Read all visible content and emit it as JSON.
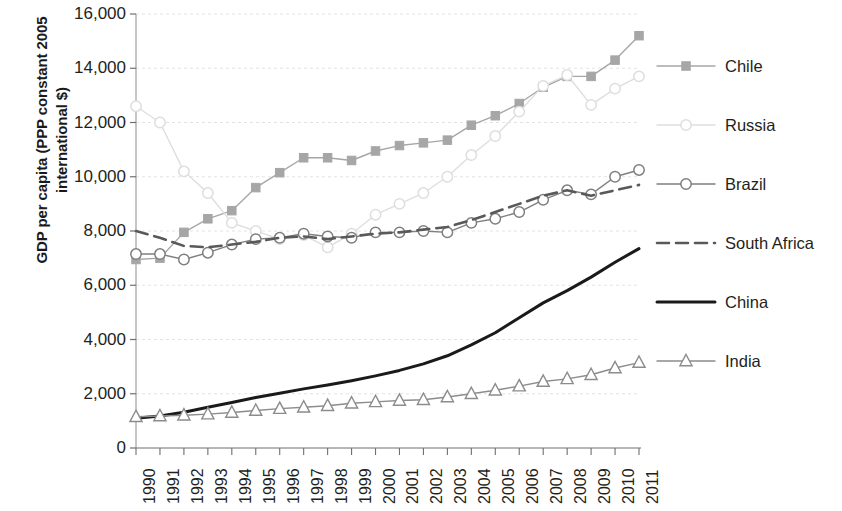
{
  "chart_data": {
    "type": "line",
    "title": "",
    "xlabel": "",
    "ylabel": "GDP per capita (PPP constant 2005\ninternational $)",
    "x": [
      1990,
      1991,
      1992,
      1993,
      1994,
      1995,
      1996,
      1997,
      1998,
      1999,
      2000,
      2001,
      2002,
      2003,
      2004,
      2005,
      2006,
      2007,
      2008,
      2009,
      2010,
      2011
    ],
    "xtick_labels": [
      "1990",
      "1991",
      "1992",
      "1993",
      "1994",
      "1995",
      "1996",
      "1997",
      "1998",
      "1999",
      "2000",
      "2001",
      "2002",
      "2003",
      "2004",
      "2005",
      "2006",
      "2007",
      "2008",
      "2009",
      "2010",
      "2011"
    ],
    "ytick_labels": [
      "0",
      "2,000",
      "4,000",
      "6,000",
      "8,000",
      "10,000",
      "12,000",
      "14,000",
      "16,000"
    ],
    "ytick_values": [
      0,
      2000,
      4000,
      6000,
      8000,
      10000,
      12000,
      14000,
      16000
    ],
    "ylim": [
      0,
      16000
    ],
    "xlim": [
      1990,
      2011
    ],
    "grid": "horizontal",
    "legend_position": "right",
    "series": [
      {
        "name": "Chile",
        "marker": "square",
        "linestyle": "solid",
        "color": "#a6a6a6",
        "values": [
          6950,
          7000,
          7950,
          8450,
          8750,
          9600,
          10150,
          10700,
          10700,
          10600,
          10950,
          11150,
          11250,
          11350,
          11900,
          12250,
          12700,
          13300,
          13700,
          13700,
          14300,
          15200
        ]
      },
      {
        "name": "Russia",
        "marker": "circle",
        "linestyle": "solid",
        "color": "#dedede",
        "values": [
          12600,
          12000,
          10200,
          9400,
          8300,
          8000,
          7700,
          7850,
          7400,
          7900,
          8600,
          9000,
          9400,
          10000,
          10800,
          11500,
          12400,
          13350,
          13750,
          12650,
          13250,
          13700
        ]
      },
      {
        "name": "Brazil",
        "marker": "circle",
        "linestyle": "solid",
        "color": "#7f7f7f",
        "values": [
          7150,
          7150,
          6950,
          7200,
          7500,
          7700,
          7750,
          7900,
          7800,
          7750,
          7950,
          7950,
          8000,
          7950,
          8300,
          8450,
          8700,
          9150,
          9500,
          9350,
          10000,
          10250
        ]
      },
      {
        "name": "South Africa",
        "marker": "none",
        "linestyle": "dashed",
        "color": "#595959",
        "values": [
          8000,
          7750,
          7450,
          7400,
          7500,
          7600,
          7750,
          7800,
          7700,
          7800,
          7900,
          7950,
          8050,
          8150,
          8400,
          8700,
          9000,
          9300,
          9500,
          9300,
          9500,
          9700
        ]
      },
      {
        "name": "China",
        "marker": "none",
        "linestyle": "solid",
        "color": "#1a1a1a",
        "values": [
          1100,
          1180,
          1320,
          1500,
          1680,
          1860,
          2020,
          2180,
          2320,
          2480,
          2660,
          2860,
          3100,
          3400,
          3800,
          4250,
          4800,
          5350,
          5800,
          6300,
          6850,
          7350
        ]
      },
      {
        "name": "India",
        "marker": "triangle",
        "linestyle": "solid",
        "color": "#8c8c8c",
        "values": [
          1150,
          1180,
          1210,
          1250,
          1310,
          1380,
          1450,
          1500,
          1560,
          1650,
          1700,
          1750,
          1780,
          1880,
          2000,
          2130,
          2280,
          2450,
          2550,
          2700,
          2950,
          3150
        ]
      }
    ]
  }
}
